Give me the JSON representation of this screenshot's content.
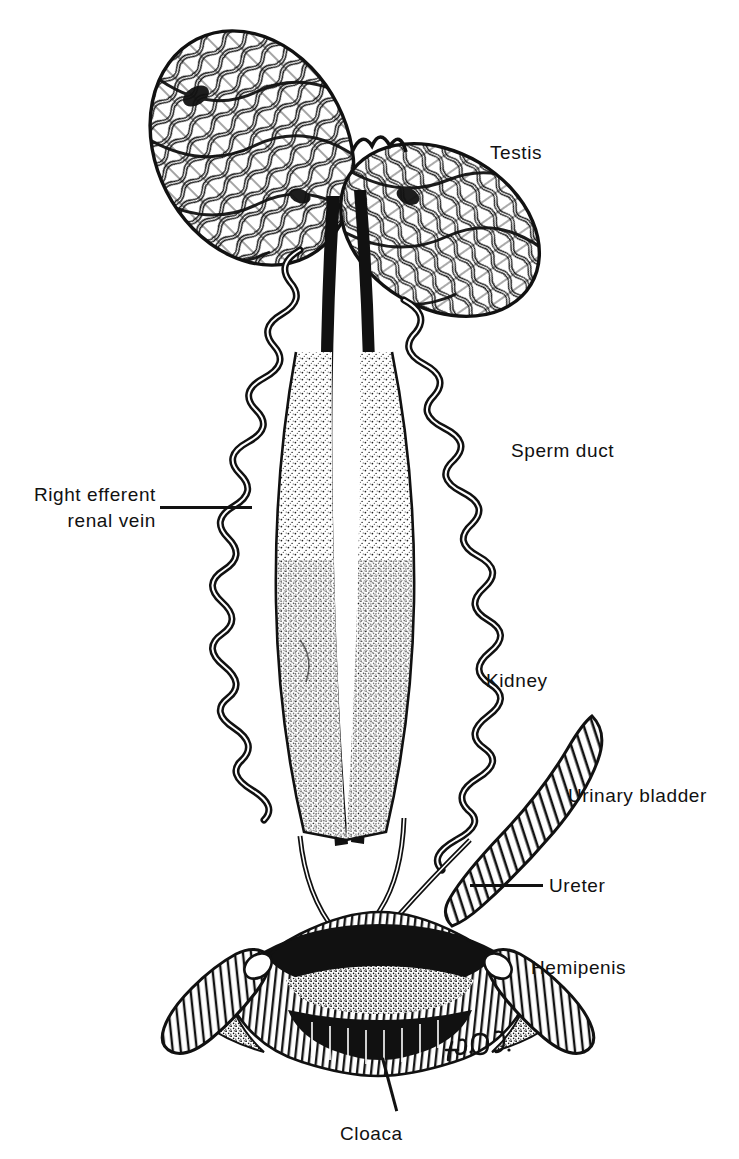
{
  "figure": {
    "style": "pen-and-ink scientific illustration",
    "background_color": "#ffffff",
    "ink_color": "#111111",
    "signature": "H.E.O."
  },
  "labels": [
    {
      "id": "testis",
      "text": "Testis",
      "x": 490,
      "y": 140,
      "align": "left",
      "leader": false
    },
    {
      "id": "sperm_duct",
      "text": "Sperm duct",
      "x": 511,
      "y": 438,
      "align": "left",
      "leader": false
    },
    {
      "id": "right_efferent_renal_vein",
      "text": "Right efferent\nrenal vein",
      "x": 20,
      "y": 482,
      "align": "right",
      "leader": true,
      "leader_line": {
        "x1": 160,
        "y1": 508,
        "x2": 252,
        "y2": 508
      }
    },
    {
      "id": "kidney",
      "text": "Kidney",
      "x": 486,
      "y": 668,
      "align": "left",
      "leader": false
    },
    {
      "id": "urinary_bladder",
      "text": "Urinary bladder",
      "x": 568,
      "y": 783,
      "align": "left",
      "leader": false
    },
    {
      "id": "ureter",
      "text": "Ureter",
      "x": 549,
      "y": 873,
      "align": "left",
      "leader": true,
      "leader_line": {
        "x1": 470,
        "y1": 886,
        "x2": 543,
        "y2": 886
      }
    },
    {
      "id": "hemipenis",
      "text": "Hemipenis",
      "x": 531,
      "y": 955,
      "align": "left",
      "leader": false
    },
    {
      "id": "cloaca",
      "text": "Cloaca",
      "x": 340,
      "y": 1121,
      "align": "left",
      "leader": true,
      "leader_line": {
        "x1": 381,
        "y1": 1058,
        "x2": 396,
        "y2": 1112
      }
    }
  ],
  "anatomy": {
    "parts": [
      {
        "name": "left-testis",
        "description": "ovoid body of dense convoluted seminiferous tubules, upper left"
      },
      {
        "name": "right-testis",
        "description": "ovoid body of dense convoluted seminiferous tubules, upper right"
      },
      {
        "name": "left-kidney",
        "description": "elongate stippled kidney, left of midline"
      },
      {
        "name": "right-kidney",
        "description": "elongate stippled kidney, right of midline"
      },
      {
        "name": "left-sperm-duct",
        "description": "highly coiled sperm duct running along left kidney"
      },
      {
        "name": "right-sperm-duct",
        "description": "highly coiled sperm duct running along right kidney"
      },
      {
        "name": "renal-veins",
        "description": "two solid black vertical vessels flanking the midline"
      },
      {
        "name": "urinary-bladder",
        "description": "finger-like transversely hatched sac on right"
      },
      {
        "name": "left-ureter",
        "description": "slender duct from left kidney to cloaca"
      },
      {
        "name": "right-ureter",
        "description": "slender duct from right kidney to cloaca"
      },
      {
        "name": "cloaca",
        "description": "broad transversely striated chamber at base"
      },
      {
        "name": "left-hemipenis",
        "description": "everted hemipenis projecting left of cloaca"
      },
      {
        "name": "right-hemipenis",
        "description": "everted hemipenis projecting right of cloaca"
      }
    ]
  }
}
